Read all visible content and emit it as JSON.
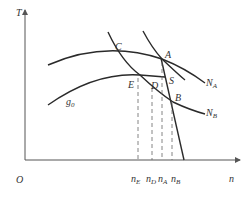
{
  "diagram": {
    "axes": {
      "y_label": "T",
      "x_label": "n",
      "origin_label": "O"
    },
    "points": {
      "C": "C",
      "A": "A",
      "S": "S",
      "E": "E",
      "D": "D",
      "B": "B"
    },
    "curve_labels": {
      "NA": "N",
      "NA_sub": "A",
      "NB": "N",
      "NB_sub": "B",
      "g0": "g",
      "g0_sub": "0"
    },
    "x_ticks": [
      {
        "main": "n",
        "sub": "E"
      },
      {
        "main": "n",
        "sub": "D"
      },
      {
        "main": "n",
        "sub": "A"
      },
      {
        "main": "n",
        "sub": "B"
      }
    ],
    "colors": {
      "line": "#2a2a2a",
      "axis": "#555555",
      "dashed": "#666666"
    }
  }
}
